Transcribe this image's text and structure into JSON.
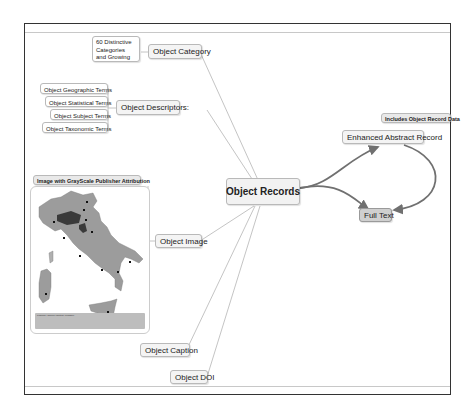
{
  "diagram": {
    "central_node": "Object Records",
    "nodes": {
      "object_category": "Object Category",
      "category_note": "60 Distinctive Categories and Growing",
      "object_descriptors": "Object Descriptors:",
      "descriptor_terms": [
        "Object Geographic Terms",
        "Object Statistical Terms",
        "Object Subject Terms",
        "Object Taxonomic Terms"
      ],
      "image_callout": "Image with GrayScale Publisher Attribution",
      "object_image": "Object Image",
      "object_caption": "Object Caption",
      "object_doi": "Object DOI",
      "enhanced_abstract": "Enhanced Abstract Record",
      "enhanced_callout": "Includes Object Record Data",
      "full_text": "Full Text"
    },
    "map_image": {
      "description": "Grayscale map of Italy",
      "caption_text": "Legend / source caption (illegible)"
    },
    "colors": {
      "node_fill": "#f4f4f4",
      "node_border": "#b9b9b9",
      "full_text_fill": "#cfcfcf",
      "map_fill": "#9c9c9c",
      "map_highlight": "#3a3a3a",
      "arrow": "#707070",
      "frame": "#333333"
    }
  }
}
